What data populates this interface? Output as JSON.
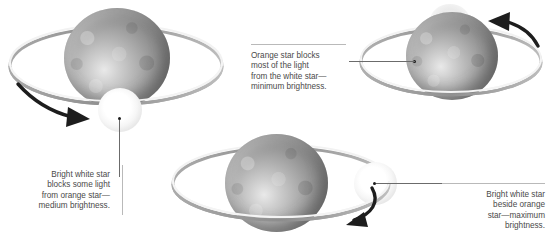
{
  "diagram": {
    "background_color": "#ffffff",
    "text_color": "#4a4a4a",
    "rule_color": "#b9b9b9",
    "leader_color": "#6b6b6b"
  },
  "callouts": [
    {
      "id": "minimum",
      "align": "left",
      "lines": [
        "Orange star blocks",
        "most of the light",
        "from the white star—",
        "minimum brightness."
      ]
    },
    {
      "id": "medium",
      "align": "right",
      "lines": [
        "Bright white star",
        "blocks some light",
        "from orange star—",
        "medium brightness."
      ]
    },
    {
      "id": "maximum",
      "align": "right",
      "lines": [
        "Bright white star",
        "beside orange",
        "star—maximum",
        "brightness."
      ]
    }
  ],
  "systems": [
    {
      "id": "top-left",
      "phase_label": "medium brightness",
      "orange_star": "orange-giant-star",
      "white_star": "white-dwarf-star",
      "white_star_position": "front-bottom",
      "arrow_direction": "right"
    },
    {
      "id": "top-right",
      "phase_label": "minimum brightness",
      "orange_star": "orange-giant-star",
      "white_star": "white-dwarf-star",
      "white_star_position": "behind-top",
      "arrow_direction": "left"
    },
    {
      "id": "bottom-center",
      "phase_label": "maximum brightness",
      "orange_star": "orange-giant-star",
      "white_star": "white-dwarf-star",
      "white_star_position": "side-right",
      "arrow_direction": "right"
    }
  ]
}
